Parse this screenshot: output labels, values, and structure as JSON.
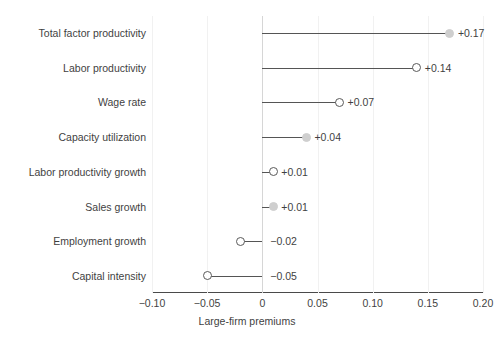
{
  "chart_data": {
    "type": "scatter",
    "subtype": "lollipop-dot-plot",
    "orientation": "horizontal",
    "title": "",
    "xlabel": "Large-firm premiums",
    "ylabel": "",
    "xlim": [
      -0.1,
      0.2
    ],
    "ylim": null,
    "grid": true,
    "grid_axis": "x",
    "legend": null,
    "zero_reference_line": 0,
    "xticks": [
      -0.1,
      -0.05,
      0,
      0.05,
      0.1,
      0.15,
      0.2
    ],
    "xticklabels": [
      "−0.10",
      "−0.05",
      "0",
      "0.05",
      "0.10",
      "0.15",
      "0.20"
    ],
    "categories": [
      "Total factor productivity",
      "Labor productivity",
      "Wage rate",
      "Capacity utilization",
      "Labor productivity growth",
      "Sales growth",
      "Employment growth",
      "Capital intensity"
    ],
    "values": [
      0.17,
      0.14,
      0.07,
      0.04,
      0.01,
      0.01,
      -0.02,
      -0.05
    ],
    "value_labels": [
      "+0.17",
      "+0.14",
      "+0.07",
      "+0.04",
      "+0.01",
      "+0.01",
      "−0.02",
      "−0.05"
    ],
    "marker_styles": [
      "filled",
      "open",
      "open",
      "filled",
      "open",
      "filled",
      "open",
      "open"
    ],
    "points": [
      {
        "category": "Total factor productivity",
        "value": 0.17,
        "label": "+0.17",
        "marker": "filled"
      },
      {
        "category": "Labor productivity",
        "value": 0.14,
        "label": "+0.14",
        "marker": "open"
      },
      {
        "category": "Wage rate",
        "value": 0.07,
        "label": "+0.07",
        "marker": "open"
      },
      {
        "category": "Capacity utilization",
        "value": 0.04,
        "label": "+0.04",
        "marker": "filled"
      },
      {
        "category": "Labor productivity growth",
        "value": 0.01,
        "label": "+0.01",
        "marker": "open"
      },
      {
        "category": "Sales growth",
        "value": 0.01,
        "label": "+0.01",
        "marker": "filled"
      },
      {
        "category": "Employment growth",
        "value": -0.02,
        "label": "−0.02",
        "marker": "open"
      },
      {
        "category": "Capital intensity",
        "value": -0.05,
        "label": "−0.05",
        "marker": "open"
      }
    ],
    "colors": {
      "marker_open_fill": "#ffffff",
      "marker_open_stroke": "#5a5a5a",
      "marker_filled": "#cfcfcf",
      "stem": "#555555",
      "axis": "#4a4a4a",
      "gridline": "#f1f1f1",
      "zero_line": "#d6d6d6",
      "text": "#3f3f3f",
      "background": "#ffffff"
    }
  }
}
